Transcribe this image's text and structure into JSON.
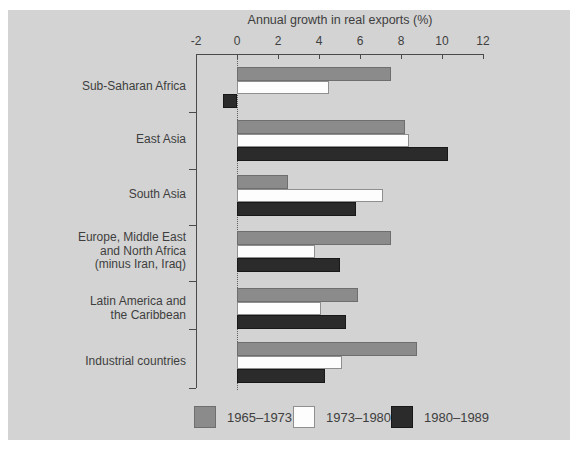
{
  "figure": {
    "background_color": "#d3d3d3",
    "outer_margin_color": "#ffffff",
    "text_color": "#3e3e3e",
    "axis_color": "#4a4a4a"
  },
  "chart_data": {
    "type": "bar",
    "orientation": "horizontal",
    "title": "Annual growth in real exports (%)",
    "xlabel": "Annual growth in real exports (%)",
    "ylabel": "",
    "grid": false,
    "zero_line_style": "dotted",
    "x_axis": {
      "min": -2,
      "max": 12,
      "tick_values": [
        -2,
        0,
        2,
        4,
        6,
        8,
        10,
        12
      ],
      "tick_labels": [
        "-2",
        "0",
        "2",
        "4",
        "6",
        "8",
        "10",
        "12"
      ],
      "position": "top"
    },
    "categories": [
      {
        "label": "Sub-Saharan Africa",
        "lines": [
          "Sub-Saharan Africa"
        ]
      },
      {
        "label": "East Asia",
        "lines": [
          "East Asia"
        ]
      },
      {
        "label": "South Asia",
        "lines": [
          "South Asia"
        ]
      },
      {
        "label": "Europe, Middle East and North Africa (minus Iran, Iraq)",
        "lines": [
          "Europe, Middle East",
          "and North Africa",
          "(minus Iran, Iraq)"
        ]
      },
      {
        "label": "Latin America and the Caribbean",
        "lines": [
          "Latin America and",
          "the Caribbean"
        ]
      },
      {
        "label": "Industrial countries",
        "lines": [
          "Industrial countries"
        ]
      }
    ],
    "series": [
      {
        "name": "1965–1973",
        "color": "#8b8b8b",
        "border_color": "#6e6e6e",
        "values": [
          7.5,
          8.2,
          2.5,
          7.5,
          5.9,
          8.8
        ]
      },
      {
        "name": "1973–1980",
        "color": "#fdfdfd",
        "border_color": "#8f8f8f",
        "values": [
          4.5,
          8.4,
          7.1,
          3.8,
          4.1,
          5.1
        ]
      },
      {
        "name": "1980–1989",
        "color": "#2b2b2b",
        "border_color": "#181818",
        "values": [
          -0.7,
          10.3,
          5.8,
          5.0,
          5.3,
          4.3
        ]
      }
    ],
    "legend": {
      "position": "bottom",
      "entries": [
        "1965–1973",
        "1973–1980",
        "1980–1989"
      ]
    }
  }
}
